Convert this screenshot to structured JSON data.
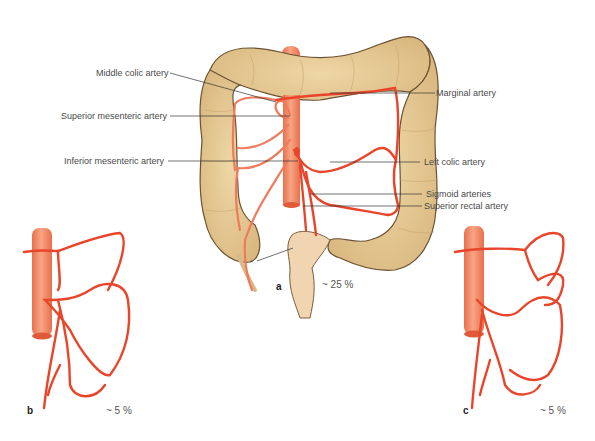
{
  "figure": {
    "labels_left": [
      {
        "id": "middle-colic",
        "text": "Middle colic artery"
      },
      {
        "id": "superior-mesenteric",
        "text": "Superior mesenteric artery"
      },
      {
        "id": "inferior-mesenteric",
        "text": "Inferior mesenteric artery"
      }
    ],
    "labels_right": [
      {
        "id": "marginal",
        "text": "Marginal artery"
      },
      {
        "id": "left-colic",
        "text": "Left colic artery"
      },
      {
        "id": "sigmoid",
        "text": "Sigmoid arteries"
      },
      {
        "id": "superior-rectal",
        "text": "Superior rectal artery"
      }
    ],
    "asterisk": "*",
    "panels": [
      {
        "letter": "a",
        "percent": "~ 25 %"
      },
      {
        "letter": "b",
        "percent": "~ 5 %"
      },
      {
        "letter": "c",
        "percent": "~ 5 %"
      }
    ],
    "colors": {
      "colon_fill": "#e3c48f",
      "colon_outline": "#6b5232",
      "artery": "#e8452a",
      "artery_light": "#ef7a5c",
      "aorta": "#f08a64",
      "label_text": "#4a4a4a",
      "leader_line": "#333333"
    }
  }
}
